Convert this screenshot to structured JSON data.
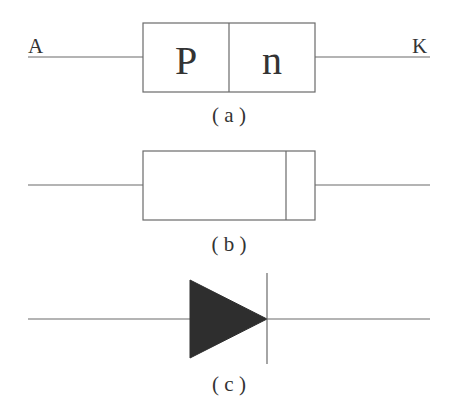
{
  "diagram": {
    "colors": {
      "stroke": "#6a6a6a",
      "fill": "#2e2e2e",
      "text": "#333333",
      "background": "#ffffff"
    },
    "a": {
      "anode_label": "A",
      "cathode_label": "K",
      "p_region_label": "P",
      "n_region_label": "n",
      "caption": "( a )"
    },
    "b": {
      "caption": "( b )"
    },
    "c": {
      "caption": "( c )"
    }
  }
}
